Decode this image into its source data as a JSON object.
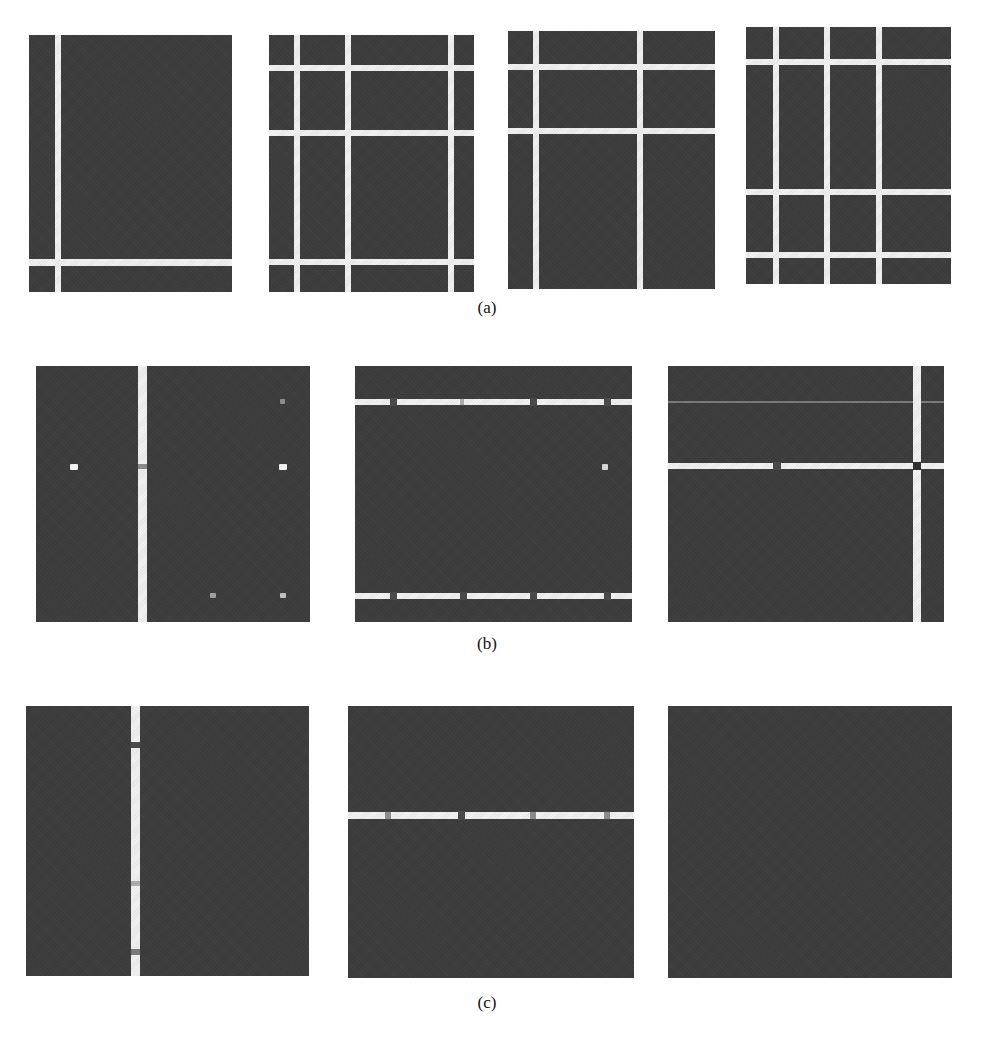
{
  "figure": {
    "captions": {
      "a": "(a)",
      "b": "(b)",
      "c": "(c)"
    },
    "panel_color": "#3d3d3d",
    "line_color": "#f2f2f2",
    "rows": {
      "a": {
        "description": "Four panels showing white grid-line partitions on dark background",
        "panel_count": 4
      },
      "b": {
        "description": "Three panels showing detected lines with noise dots and breaks",
        "panel_count": 3
      },
      "c": {
        "description": "Three panels: one vertical line, one horizontal line, one empty",
        "panel_count": 3
      }
    }
  }
}
